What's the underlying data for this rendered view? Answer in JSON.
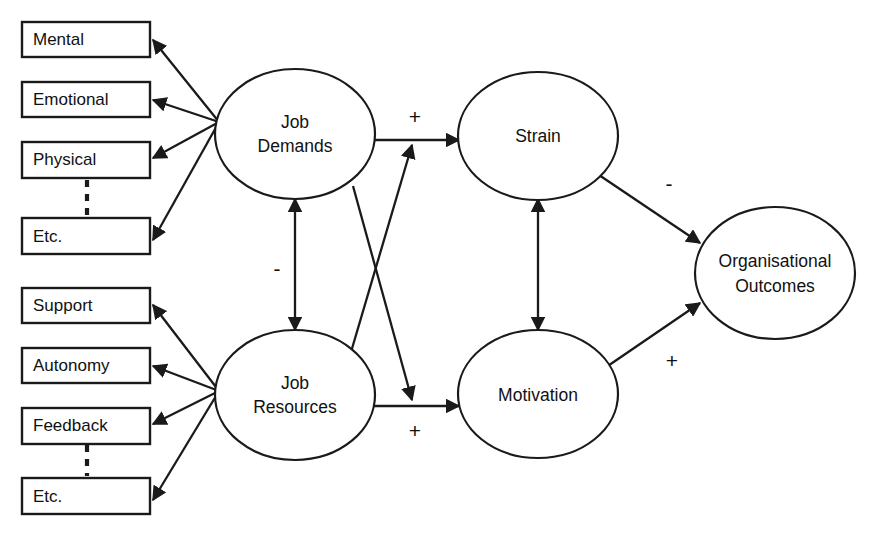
{
  "diagram": {
    "type": "path-model",
    "nodes": {
      "demand_indicators": [
        {
          "id": "mental",
          "label": "Mental"
        },
        {
          "id": "emotional",
          "label": "Emotional"
        },
        {
          "id": "physical",
          "label": "Physical"
        },
        {
          "id": "etc_demands",
          "label": "Etc."
        }
      ],
      "resource_indicators": [
        {
          "id": "support",
          "label": "Support"
        },
        {
          "id": "autonomy",
          "label": "Autonomy"
        },
        {
          "id": "feedback",
          "label": "Feedback"
        },
        {
          "id": "etc_resources",
          "label": "Etc."
        }
      ],
      "latent": [
        {
          "id": "job_demands",
          "line1": "Job",
          "line2": "Demands"
        },
        {
          "id": "job_resources",
          "line1": "Job",
          "line2": "Resources"
        },
        {
          "id": "strain",
          "line1": "Strain",
          "line2": ""
        },
        {
          "id": "motivation",
          "line1": "Motivation",
          "line2": ""
        },
        {
          "id": "organisational_outcomes",
          "line1": "Organisational",
          "line2": "Outcomes"
        }
      ]
    },
    "edges": [
      {
        "id": "demands-to-mental",
        "from": "job_demands",
        "to": "mental",
        "sign": ""
      },
      {
        "id": "demands-to-emotional",
        "from": "job_demands",
        "to": "emotional",
        "sign": ""
      },
      {
        "id": "demands-to-physical",
        "from": "job_demands",
        "to": "physical",
        "sign": ""
      },
      {
        "id": "demands-to-etc",
        "from": "job_demands",
        "to": "etc_demands",
        "sign": ""
      },
      {
        "id": "resources-to-support",
        "from": "job_resources",
        "to": "support",
        "sign": ""
      },
      {
        "id": "resources-to-autonomy",
        "from": "job_resources",
        "to": "autonomy",
        "sign": ""
      },
      {
        "id": "resources-to-feedback",
        "from": "job_resources",
        "to": "feedback",
        "sign": ""
      },
      {
        "id": "resources-to-etc",
        "from": "job_resources",
        "to": "etc_resources",
        "sign": ""
      },
      {
        "id": "demands-resources-correlation",
        "from": "job_demands",
        "to": "job_resources",
        "sign": "-",
        "bidirectional": true
      },
      {
        "id": "demands-to-strain",
        "from": "job_demands",
        "to": "strain",
        "sign": "+"
      },
      {
        "id": "resources-to-motivation",
        "from": "job_resources",
        "to": "motivation",
        "sign": "+"
      },
      {
        "id": "resources-buffers-strain",
        "from": "job_resources",
        "to": "demands-to-strain",
        "sign": ""
      },
      {
        "id": "demands-moderates-motivation",
        "from": "job_demands",
        "to": "resources-to-motivation",
        "sign": ""
      },
      {
        "id": "strain-motivation-correlation",
        "from": "strain",
        "to": "motivation",
        "sign": "",
        "bidirectional": true
      },
      {
        "id": "strain-to-outcomes",
        "from": "strain",
        "to": "organisational_outcomes",
        "sign": "-"
      },
      {
        "id": "motivation-to-outcomes",
        "from": "motivation",
        "to": "organisational_outcomes",
        "sign": "+"
      }
    ],
    "signs": {
      "demands_strain": "+",
      "resources_motivation": "+",
      "demands_resources": "-",
      "strain_outcomes": "-",
      "motivation_outcomes": "+"
    },
    "colors": {
      "stroke": "#1a1a1a",
      "fill": "#ffffff",
      "text": "#111111",
      "background": "#ffffff"
    }
  }
}
